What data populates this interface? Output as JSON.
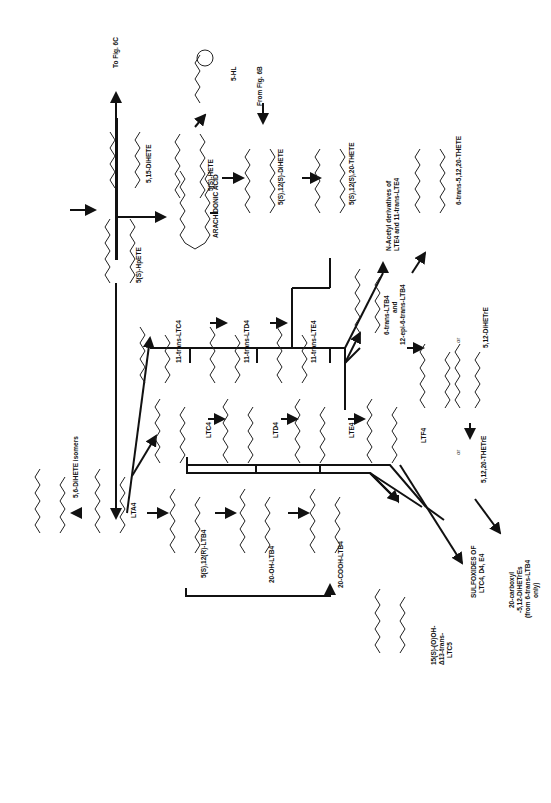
{
  "diagram": {
    "orientation": "rotated 90 degrees counter-clockwise",
    "nodes": [
      {
        "id": "aa",
        "label": "ARACHIDONIC ACID",
        "group": "COOH"
      },
      {
        "id": "hpete",
        "label": "5(S)-HpETE",
        "group": "OOH"
      },
      {
        "id": "diHETE515",
        "label": "5,15-DiHETE",
        "group": "OH"
      },
      {
        "id": "hete",
        "label": "5(S)-HETE",
        "group": "OH"
      },
      {
        "id": "hl",
        "label": "5-HL",
        "group": "lactone"
      },
      {
        "id": "diHETE512",
        "label": "5(S),12(S)-DiHETE",
        "group": "OH"
      },
      {
        "id": "trihete1",
        "label": "5(S),12(S),20-THETE",
        "group": "OH"
      },
      {
        "id": "lta4",
        "label": "LTA4",
        "group": "epoxide"
      },
      {
        "id": "diHETE56",
        "label": "5,6-DiHETE isomers",
        "group": "OH"
      },
      {
        "id": "ltb4",
        "label": "5(S),12(R)-LTB4",
        "group": "OH"
      },
      {
        "id": "oh_ltb4",
        "label": "20-OH-LTB4",
        "group": "OH"
      },
      {
        "id": "cooh_ltb4",
        "label": "20-COOH-LTB4",
        "group": "COOH"
      },
      {
        "id": "ltc4",
        "label": "LTC4",
        "group": "glutathione"
      },
      {
        "id": "ltd4",
        "label": "LTD4",
        "group": "cysteinylglycine"
      },
      {
        "id": "lte4",
        "label": "LTE4",
        "group": "cysteine"
      },
      {
        "id": "ltf4",
        "label": "LTF4",
        "group": "gamma-glutamylcysteine"
      },
      {
        "id": "t_ltc4",
        "label": "11-trans-LTC4"
      },
      {
        "id": "t_ltd4",
        "label": "11-trans-LTD4"
      },
      {
        "id": "t_lte4",
        "label": "11-trans-LTE4"
      },
      {
        "id": "n_acetyl",
        "label": "N-Acetyl derivatives of LTE4 and 11-trans-LTE4"
      },
      {
        "id": "trans_ltb4",
        "label": "6-trans-LTB4 and 12-epi-6-trans-LTB4"
      },
      {
        "id": "diHETrE",
        "label": "5,12-DiHETrE"
      },
      {
        "id": "trans_thete",
        "label": "6-trans-5,12,20-THETE"
      },
      {
        "id": "thetre",
        "label": "5,12,20-THETrE"
      },
      {
        "id": "sulfoxides",
        "label": "SULFOXIDES OF LTC4, D4, E4"
      },
      {
        "id": "carboxy",
        "label": "20-carboxyl-5,12-DiHETrEs (from 6-trans-LTB4 only)"
      },
      {
        "id": "ltc5",
        "label": "15(S)-(O)OH-Δ13-trans-LTC5"
      }
    ],
    "texts": {
      "aa": "ARACHIDONIC ACID",
      "hpete": "5(S)-HpETE",
      "diHETE515": "5,15-DiHETE",
      "to_fig": "To Fig. 6C",
      "from_fig": "From Fig. 6B",
      "hete": "5(S)-HETE",
      "hl": "5-HL",
      "diHETE512": "5(S),12(S)-DiHETE",
      "trihete1": "5(S),12(S),20-THETE",
      "n_acetyl_1": "N-Acetyl derivatives of",
      "n_acetyl_2": "LTE4 and 11-trans-LTE4",
      "trans_thete": "6-trans-5,12,20-THETE",
      "t_ltc4": "11-trans-LTC4",
      "t_ltd4": "11-trans-LTD4",
      "t_lte4": "11-trans-LTE4",
      "trans_ltb4_1": "6-trans-LTB4",
      "trans_ltb4_2": "and",
      "trans_ltb4_3": "12-epi-6-trans-LTB4",
      "diHETrE": "5,12-DiHETrE",
      "or1": "or",
      "or2": "or",
      "ltc4": "LTC4",
      "ltd4": "LTD4",
      "lte4": "LTE4",
      "ltf4": "LTF4",
      "thetre": "5,12,20-THETrE",
      "lta4": "LTA4",
      "diHETE56": "5,6-DiHETE isomers",
      "ltb4": "5(S),12(R)-LTB4",
      "oh_ltb4": "20-OH-LTB4",
      "cooh_ltb4": "20-COOH-LTB4",
      "ltc5_1": "15(S)-(O)OH-",
      "ltc5_2": "Δ13-trans-",
      "ltc5_3": "LTC5",
      "sulfox_1": "SULFOXIDES OF",
      "sulfox_2": "LTC4, D4, E4",
      "carb_1": "20-carboxyl",
      "carb_2": "-5,12-DiHETrEs",
      "carb_3": "(from 6-trans-LTB4",
      "carb_4": "only)"
    },
    "groups": {
      "cooh": "COOH",
      "ooh": "OOH",
      "oh": "OH",
      "ho": "HO",
      "o": "O",
      "glutathione_1": "CH2CHCONHCH2COOH",
      "glutathione_2": "NHCOCH2CH2CHCOOH",
      "nh2": "NH2",
      "cysgly": "CH2CHCONHCH2COOH",
      "cys": "CH2CHCOOH",
      "s": "S",
      "sch2": "S-CH2",
      "chcooh": "CH-COOH",
      "chconhch2cooh": "CHCONHCH2COOH",
      "h": "H",
      "hoo": "HO(O)"
    }
  }
}
